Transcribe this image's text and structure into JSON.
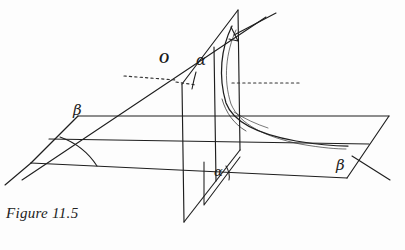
{
  "figure": {
    "caption": "Figure 11.5",
    "title": "Figure 11.5",
    "background_color": "#fdfdfd",
    "ink_color": "#1a1a1a",
    "labels": {
      "origin": "O",
      "alpha_upper": "α",
      "alpha_lower": "α",
      "beta_left": "β",
      "beta_right": "β"
    },
    "label_positions": {
      "origin": {
        "x": 159,
        "y": 53
      },
      "alpha_upper": {
        "x": 196,
        "y": 55
      },
      "alpha_lower": {
        "x": 215,
        "y": 167
      },
      "beta_left": {
        "x": 73,
        "y": 104
      },
      "beta_right": {
        "x": 337,
        "y": 160
      }
    },
    "elements": {
      "horizontal_plane": "beta-plane-parallelogram",
      "vertical_plane": "alpha-plane-parallelogram",
      "dotted_axis": "horizontal-dotted-axis",
      "hyperbola_curve": "conic-section-curve",
      "angle_arc_upper": "angle-arc-at-origin",
      "angle_arc_lower": "angle-arc-lower",
      "angle_arc_base": "angle-arc-base-plane"
    }
  },
  "geometry": {
    "beta_plane": [
      {
        "x": 78,
        "y": 116
      },
      {
        "x": 389,
        "y": 116
      },
      {
        "x": 347,
        "y": 178
      },
      {
        "x": 31,
        "y": 163
      }
    ],
    "beta_plane_inner_lines": [
      [
        {
          "x": 49,
          "y": 139
        },
        {
          "x": 369,
          "y": 144
        }
      ],
      [
        {
          "x": 31,
          "y": 163
        },
        {
          "x": 347,
          "y": 178
        }
      ]
    ],
    "alpha_plane": [
      {
        "x": 238,
        "y": 10
      },
      {
        "x": 182,
        "y": 84
      },
      {
        "x": 184,
        "y": 222
      },
      {
        "x": 240,
        "y": 150
      }
    ],
    "dotted_axis": {
      "y_left": 78,
      "x_start": 124,
      "x_end": 217,
      "y_right": 83,
      "x2_start": 232,
      "x2_end": 300
    },
    "curve_points": [
      {
        "x": 231,
        "y": 27
      },
      {
        "x": 222,
        "y": 60
      },
      {
        "x": 222,
        "y": 95
      },
      {
        "x": 238,
        "y": 118
      },
      {
        "x": 268,
        "y": 131
      },
      {
        "x": 305,
        "y": 140
      },
      {
        "x": 340,
        "y": 143
      }
    ]
  }
}
